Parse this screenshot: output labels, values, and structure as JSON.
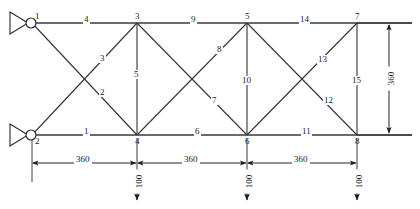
{
  "diagram": {
    "units_note": "",
    "geometry": {
      "panel_length": 360,
      "truss_height": 360,
      "load_magnitude": 100
    },
    "nodes": [
      {
        "id": "1",
        "label": "1",
        "x": 32,
        "y": 23,
        "label_dx": 3,
        "label_dy": -11
      },
      {
        "id": "2",
        "label": "2",
        "x": 32,
        "y": 135,
        "label_dx": 3,
        "label_dy": 2
      },
      {
        "id": "3",
        "label": "3",
        "x": 137,
        "y": 23,
        "label_dx": -2,
        "label_dy": -11
      },
      {
        "id": "4",
        "label": "4",
        "x": 137,
        "y": 135,
        "label_dx": -2,
        "label_dy": 2
      },
      {
        "id": "5",
        "label": "5",
        "x": 247,
        "y": 23,
        "label_dx": -2,
        "label_dy": -11
      },
      {
        "id": "6",
        "label": "6",
        "x": 247,
        "y": 135,
        "label_dx": -2,
        "label_dy": 2
      },
      {
        "id": "7",
        "label": "7",
        "x": 357,
        "y": 23,
        "label_dx": -2,
        "label_dy": -11
      },
      {
        "id": "8",
        "label": "8",
        "x": 357,
        "y": 135,
        "label_dx": -2,
        "label_dy": 2
      }
    ],
    "members": [
      {
        "id": "1",
        "label": "1",
        "from": "2",
        "to": "4",
        "kind": "bottom-chord",
        "label_x": 85,
        "label_y": 130
      },
      {
        "id": "2",
        "label": "2",
        "from": "1",
        "to": "4",
        "kind": "diagonal",
        "label_x": 101,
        "label_y": 92
      },
      {
        "id": "3",
        "label": "3",
        "from": "2",
        "to": "3",
        "kind": "diagonal",
        "label_x": 101,
        "label_y": 58
      },
      {
        "id": "4",
        "label": "4",
        "from": "1",
        "to": "3",
        "kind": "top-chord",
        "label_x": 85,
        "label_y": 18
      },
      {
        "id": "5",
        "label": "5",
        "from": "3",
        "to": "4",
        "kind": "vertical",
        "label_x": 137,
        "label_y": 75
      },
      {
        "id": "6",
        "label": "6",
        "from": "4",
        "to": "6",
        "kind": "bottom-chord",
        "label_x": 196,
        "label_y": 130
      },
      {
        "id": "7",
        "label": "7",
        "from": "3",
        "to": "6",
        "kind": "diagonal",
        "label_x": 213,
        "label_y": 100
      },
      {
        "id": "8",
        "label": "8",
        "from": "4",
        "to": "5",
        "kind": "diagonal",
        "label_x": 218,
        "label_y": 49
      },
      {
        "id": "9",
        "label": "9",
        "from": "3",
        "to": "5",
        "kind": "top-chord",
        "label_x": 192,
        "label_y": 18
      },
      {
        "id": "10",
        "label": "10",
        "from": "5",
        "to": "6",
        "kind": "vertical",
        "label_x": 247,
        "label_y": 81
      },
      {
        "id": "11",
        "label": "11",
        "from": "6",
        "to": "8",
        "kind": "bottom-chord",
        "label_x": 306,
        "label_y": 130
      },
      {
        "id": "12",
        "label": "12",
        "from": "5",
        "to": "8",
        "kind": "diagonal",
        "label_x": 328,
        "label_y": 100
      },
      {
        "id": "13",
        "label": "13",
        "from": "6",
        "to": "7",
        "kind": "diagonal",
        "label_x": 322,
        "label_y": 59
      },
      {
        "id": "14",
        "label": "14",
        "from": "5",
        "to": "7",
        "kind": "top-chord",
        "label_x": 302,
        "label_y": 18
      },
      {
        "id": "15",
        "label": "15",
        "from": "7",
        "to": "8",
        "kind": "vertical",
        "label_x": 357,
        "label_y": 81
      }
    ],
    "supports": [
      {
        "at_node": "1",
        "type": "pin-roller-triangle"
      },
      {
        "at_node": "2",
        "type": "pin-roller-triangle"
      }
    ],
    "loads": [
      {
        "at_node": "4",
        "label": "100",
        "value": 100,
        "direction": "down"
      },
      {
        "at_node": "6",
        "label": "100",
        "value": 100,
        "direction": "down"
      },
      {
        "at_node": "8",
        "label": "100",
        "value": 100,
        "direction": "down"
      }
    ],
    "dimensions_horizontal": [
      {
        "label": "360",
        "value": 360,
        "from_x": 32,
        "to_x": 137,
        "y": 163,
        "label_x": 84,
        "label_y": 158
      },
      {
        "label": "360",
        "value": 360,
        "from_x": 137,
        "to_x": 247,
        "y": 163,
        "label_x": 192,
        "label_y": 158
      },
      {
        "label": "360",
        "value": 360,
        "from_x": 247,
        "to_x": 357,
        "y": 163,
        "label_x": 302,
        "label_y": 158
      }
    ],
    "dimensions_vertical": [
      {
        "label": "360",
        "value": 360,
        "x": 389,
        "from_y": 23,
        "to_y": 135,
        "label_x": 389,
        "label_y": 79
      }
    ]
  }
}
